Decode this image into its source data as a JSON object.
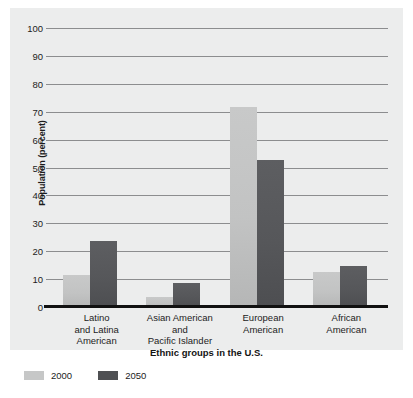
{
  "chart_data": {
    "type": "bar",
    "title": "",
    "xlabel": "Ethnic groups in the U.S.",
    "ylabel": "Population (percent)",
    "ylim": [
      0,
      100
    ],
    "ytick_step": 10,
    "yticks": [
      "100",
      "90",
      "80",
      "70",
      "60",
      "50",
      "40",
      "30",
      "20",
      "10",
      "0"
    ],
    "grid": true,
    "legend_position": "bottom-left",
    "categories": [
      "Latino\nand Latina\nAmerican",
      "Asian American\nand\nPacific Islander",
      "European\nAmerican",
      "African\nAmerican"
    ],
    "category_labels": [
      {
        "line1": "Latino",
        "line2": "and Latina",
        "line3": "American"
      },
      {
        "line1": "Asian American",
        "line2": "and",
        "line3": "Pacific Islander"
      },
      {
        "line1": "European",
        "line2": "American",
        "line3": ""
      },
      {
        "line1": "African",
        "line2": "American",
        "line3": ""
      }
    ],
    "series": [
      {
        "name": "2000",
        "color": "#c6c7c7",
        "values": [
          12,
          4,
          72,
          13
        ]
      },
      {
        "name": "2050",
        "color": "#4f5053",
        "values": [
          24,
          9,
          53,
          15
        ]
      }
    ]
  },
  "legend": {
    "items": [
      {
        "label": "2000"
      },
      {
        "label": "2050"
      }
    ]
  }
}
